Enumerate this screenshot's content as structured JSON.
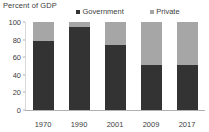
{
  "chart_data": {
    "type": "bar",
    "subtype": "stacked-bar",
    "title": "Percent of GDP",
    "xlabel": "",
    "ylabel": "",
    "categories": [
      "1970",
      "1990",
      "2001",
      "2009",
      "2017"
    ],
    "series": [
      {
        "name": "Government",
        "color": "#333333",
        "values": [
          78,
          94,
          74,
          51,
          51
        ]
      },
      {
        "name": "Private",
        "color": "#a6a6a6",
        "values": [
          22,
          6,
          26,
          49,
          49
        ]
      }
    ],
    "ylim": [
      0,
      100
    ],
    "yticks": [
      "0",
      "20",
      "40",
      "60",
      "80",
      "100"
    ],
    "grid": false,
    "legend_position": "top"
  },
  "legend": {
    "items": [
      {
        "label": "Government",
        "color": "#333333"
      },
      {
        "label": "Private",
        "color": "#a6a6a6"
      }
    ]
  }
}
